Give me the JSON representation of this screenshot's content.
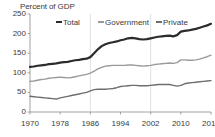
{
  "chart_data": {
    "type": "line",
    "title": "",
    "ylabel": "Percent of GDP",
    "xlabel": "",
    "ylim": [
      0,
      250
    ],
    "xlim": [
      1970,
      2018
    ],
    "yticks": [
      0,
      50,
      100,
      150,
      200,
      250
    ],
    "xticks": [
      1970,
      1978,
      1986,
      1994,
      2002,
      2010,
      2018
    ],
    "grid": "vertical-gridlines-at-1986-and-2002",
    "legend_position": "top-inside",
    "x": [
      1970,
      1971,
      1972,
      1973,
      1974,
      1975,
      1976,
      1977,
      1978,
      1979,
      1980,
      1981,
      1982,
      1983,
      1984,
      1985,
      1986,
      1987,
      1988,
      1989,
      1990,
      1991,
      1992,
      1993,
      1994,
      1995,
      1996,
      1997,
      1998,
      1999,
      2000,
      2001,
      2002,
      2003,
      2004,
      2005,
      2006,
      2007,
      2008,
      2009,
      2010,
      2011,
      2012,
      2013,
      2014,
      2015,
      2016,
      2017,
      2018
    ],
    "series": [
      {
        "name": "Total",
        "color": "#2b2b2b",
        "width": 2.2,
        "values": [
          115,
          116,
          118,
          119,
          120,
          122,
          123,
          124,
          126,
          127,
          128,
          130,
          132,
          133,
          135,
          136,
          140,
          150,
          160,
          168,
          173,
          176,
          178,
          180,
          183,
          185,
          188,
          189,
          188,
          186,
          185,
          186,
          188,
          190,
          192,
          193,
          194,
          195,
          193,
          196,
          205,
          207,
          208,
          210,
          212,
          215,
          218,
          221,
          225
        ]
      },
      {
        "name": "Government",
        "color": "#9a9a9a",
        "width": 1.4,
        "values": [
          78,
          79,
          81,
          83,
          84,
          86,
          87,
          88,
          89,
          88,
          87,
          88,
          90,
          92,
          94,
          96,
          99,
          104,
          110,
          114,
          117,
          118,
          119,
          119,
          119,
          119,
          120,
          120,
          119,
          118,
          117,
          118,
          119,
          121,
          122,
          123,
          124,
          125,
          124,
          126,
          133,
          133,
          132,
          132,
          133,
          135,
          138,
          141,
          145
        ]
      },
      {
        "name": "Private",
        "color": "#6e6e6e",
        "width": 1.4,
        "values": [
          40,
          39,
          38,
          37,
          36,
          35,
          34,
          33,
          36,
          38,
          40,
          42,
          44,
          46,
          48,
          50,
          54,
          57,
          58,
          58,
          58,
          59,
          60,
          62,
          65,
          66,
          67,
          68,
          68,
          67,
          67,
          67,
          68,
          69,
          70,
          70,
          70,
          70,
          68,
          66,
          68,
          72,
          74,
          75,
          76,
          77,
          78,
          79,
          80
        ]
      }
    ],
    "legend": [
      {
        "label": "Total",
        "color": "#2b2b2b"
      },
      {
        "label": "Government",
        "color": "#9a9a9a"
      },
      {
        "label": "Private",
        "color": "#6e6e6e"
      }
    ]
  },
  "axis": {
    "y_label_text": "Percent of GDP",
    "y_tick_labels": [
      "250",
      "200",
      "150",
      "100",
      "50",
      "0"
    ],
    "x_tick_labels": [
      "1970",
      "1978",
      "1986",
      "1994",
      "2002",
      "2010",
      "2018"
    ]
  },
  "legend_labels": {
    "total": "Total",
    "government": "Government",
    "private": "Private"
  },
  "colors": {
    "total": "#2b2b2b",
    "government": "#9a9a9a",
    "private": "#6e6e6e",
    "axis": "#8c8c8c",
    "grid": "#d8d8d8",
    "text": "#3a3a3a"
  }
}
